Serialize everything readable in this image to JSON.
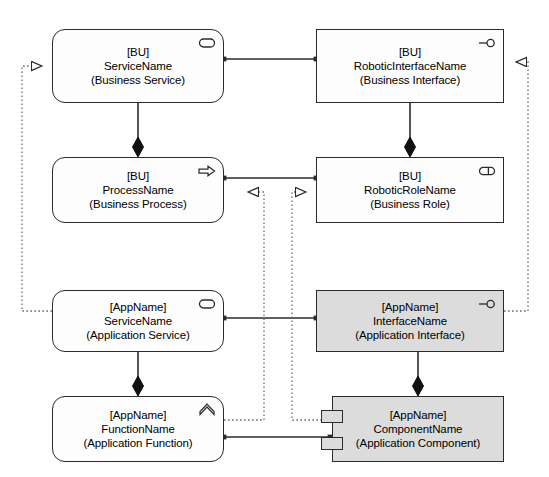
{
  "diagram": {
    "colors": {
      "stroke": "#2b2b2b",
      "fill_white": "#fdfdfd",
      "fill_grey": "#dcdcdc",
      "background": "#ffffff"
    },
    "nodes": [
      {
        "id": "business-service",
        "qualifier": "[BU]",
        "name": "ServiceName",
        "type": "(Business Service)",
        "shape": "rounded-rectangle",
        "fill": "white",
        "icon": "rounded-rect-service-icon",
        "x": 52,
        "y": 29,
        "w": 172,
        "h": 74
      },
      {
        "id": "business-interface",
        "qualifier": "[BU]",
        "name": "RoboticInterfaceName",
        "type": "(Business Interface)",
        "shape": "rectangle",
        "fill": "white",
        "icon": "lollipop-interface-icon",
        "x": 316,
        "y": 29,
        "w": 188,
        "h": 74
      },
      {
        "id": "business-process",
        "qualifier": "[BU]",
        "name": "ProcessName",
        "type": "(Business Process)",
        "shape": "rounded-rectangle",
        "fill": "white",
        "icon": "arrow-right-process-icon",
        "x": 52,
        "y": 157,
        "w": 172,
        "h": 66
      },
      {
        "id": "business-role",
        "qualifier": "[BU]",
        "name": "RoboticRoleName",
        "type": "(Business Role)",
        "shape": "rectangle",
        "fill": "white",
        "icon": "cylinder-role-icon",
        "x": 316,
        "y": 157,
        "w": 188,
        "h": 66
      },
      {
        "id": "application-service",
        "qualifier": "[AppName]",
        "name": "ServiceName",
        "type": "(Application Service)",
        "shape": "rounded-rectangle",
        "fill": "white",
        "icon": "rounded-rect-service-icon",
        "x": 52,
        "y": 290,
        "w": 172,
        "h": 62
      },
      {
        "id": "application-interface",
        "qualifier": "[AppName]",
        "name": "InterfaceName",
        "type": "(Application Interface)",
        "shape": "rectangle",
        "fill": "grey",
        "icon": "lollipop-interface-icon",
        "x": 316,
        "y": 290,
        "w": 188,
        "h": 62
      },
      {
        "id": "application-function",
        "qualifier": "[AppName]",
        "name": "FunctionName",
        "type": "(Application Function)",
        "shape": "rounded-rectangle",
        "fill": "white",
        "icon": "chevron-up-function-icon",
        "x": 52,
        "y": 396,
        "w": 172,
        "h": 66
      },
      {
        "id": "application-component",
        "qualifier": "[AppName]",
        "name": "ComponentName",
        "type": "(Application Component)",
        "shape": "uml-component",
        "fill": "grey",
        "icon": "none",
        "x": 332,
        "y": 396,
        "w": 172,
        "h": 66
      }
    ],
    "relationships": [
      {
        "kind": "association",
        "from": "business-service",
        "to": "business-interface"
      },
      {
        "kind": "association",
        "from": "business-process",
        "to": "business-role"
      },
      {
        "kind": "association",
        "from": "application-service",
        "to": "application-interface"
      },
      {
        "kind": "association",
        "from": "application-function",
        "to": "application-component"
      },
      {
        "kind": "composition",
        "from": "business-service",
        "to": "business-process"
      },
      {
        "kind": "composition",
        "from": "business-interface",
        "to": "business-role"
      },
      {
        "kind": "composition",
        "from": "application-service",
        "to": "application-function"
      },
      {
        "kind": "composition",
        "from": "application-interface",
        "to": "application-component"
      },
      {
        "kind": "realization",
        "from": "application-service",
        "to": "business-service"
      },
      {
        "kind": "realization",
        "from": "application-interface",
        "to": "business-interface"
      },
      {
        "kind": "realization",
        "from": "application-function",
        "to": "business-process"
      },
      {
        "kind": "realization",
        "from": "application-component",
        "to": "business-role"
      }
    ]
  }
}
